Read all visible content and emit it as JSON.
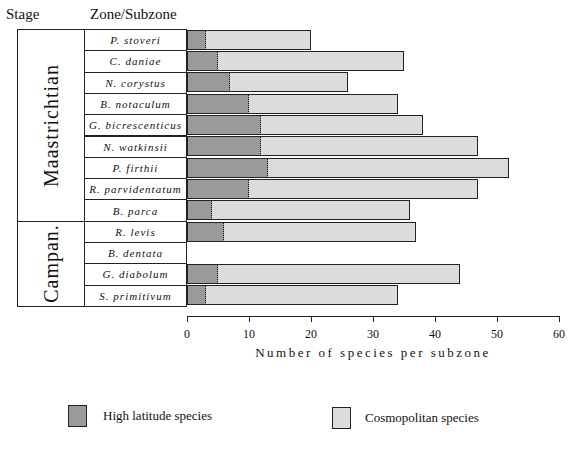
{
  "headers": {
    "stage": "Stage",
    "zone": "Zone/Subzone"
  },
  "stages": [
    {
      "label": "Maastrichtian",
      "rows": 9
    },
    {
      "label": "Campan.",
      "rows": 4
    }
  ],
  "chart_data": {
    "type": "bar",
    "orientation": "horizontal",
    "stacked": true,
    "title": "",
    "xlabel": "Number of species per subzone",
    "ylabel": "Zone/Subzone",
    "xlim": [
      0,
      60
    ],
    "xticks": [
      "0",
      "10",
      "20",
      "30",
      "40",
      "50",
      "60"
    ],
    "categories": [
      "P. stoveri",
      "C. daniae",
      "N. corystus",
      "B. notaculum",
      "G. bicrescenticus",
      "N. watkinsii",
      "P. firthii",
      "R. parvidentatum",
      "B. parca",
      "R. levis",
      "B. dentata",
      "G. diabolum",
      "S. primitivum"
    ],
    "stage_groups": [
      {
        "stage": "Maastrichtian",
        "categories": [
          "P. stoveri",
          "C. daniae",
          "N. corystus",
          "B. notaculum",
          "G. bicrescenticus",
          "N. watkinsii",
          "P. firthii",
          "R. parvidentatum",
          "B. parca"
        ]
      },
      {
        "stage": "Campan.",
        "categories": [
          "R. levis",
          "B. dentata",
          "G. diabolum",
          "S. primitivum"
        ]
      }
    ],
    "series": [
      {
        "name": "High latitude species",
        "values": [
          3,
          5,
          7,
          10,
          12,
          12,
          13,
          10,
          4,
          6,
          0,
          5,
          3
        ]
      },
      {
        "name": "Cosmopolitan species",
        "values": [
          17,
          30,
          19,
          24,
          26,
          35,
          39,
          37,
          32,
          31,
          0,
          39,
          31
        ]
      }
    ],
    "totals": [
      20,
      35,
      26,
      34,
      38,
      47,
      52,
      47,
      36,
      37,
      0,
      44,
      34
    ],
    "grid": false,
    "legend_position": "bottom"
  },
  "legend": [
    {
      "label": "High latitude species"
    },
    {
      "label": "Cosmopolitan species"
    }
  ]
}
